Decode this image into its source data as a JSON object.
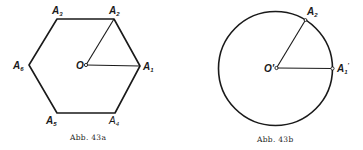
{
  "figures": [
    {
      "id": "43a",
      "caption": "Abb. 43a",
      "shape": "regular-hexagon",
      "center_label": "O",
      "vertices": [
        {
          "label": "A",
          "sub": "1"
        },
        {
          "label": "A",
          "sub": "2"
        },
        {
          "label": "A",
          "sub": "3"
        },
        {
          "label": "A",
          "sub": "4"
        },
        {
          "label": "A",
          "sub": "5"
        },
        {
          "label": "A",
          "sub": "6"
        }
      ],
      "segments": [
        "O-A1",
        "O-A2"
      ]
    },
    {
      "id": "43b",
      "caption": "Abb. 43b",
      "shape": "circle",
      "center_label": "O'",
      "points": [
        {
          "label": "A",
          "sub": "2"
        },
        {
          "label": "A",
          "sub": "1",
          "prime": "'"
        }
      ],
      "segments": [
        "O'-A1'",
        "O'-A2"
      ]
    }
  ]
}
